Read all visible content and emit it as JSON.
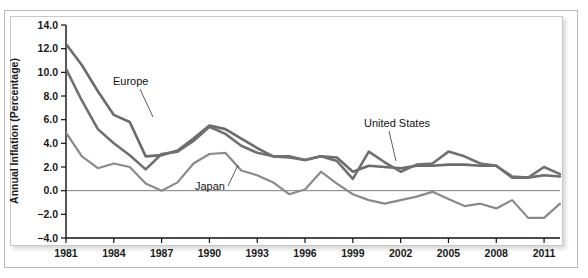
{
  "figure": {
    "background_color": "#ffffff",
    "frame_color": "#b9b9b9",
    "panel_border_color": "#c8c8c8"
  },
  "chart_data": {
    "type": "line",
    "title": "",
    "subtitle": "",
    "xlabel": "",
    "ylabel": "Annual Inflation (Percentage)",
    "xlim": [
      1981,
      2012
    ],
    "ylim": [
      -4.0,
      14.0
    ],
    "grid": false,
    "legend_position": "inline-annotations",
    "y_ticks": [
      -4.0,
      -2.0,
      0.0,
      2.0,
      4.0,
      6.0,
      8.0,
      10.0,
      12.0,
      14.0
    ],
    "y_tick_labels": [
      "−4.0",
      "−2.0",
      "0.0",
      "2.0",
      "4.0",
      "6.0",
      "8.0",
      "10.0",
      "12.0",
      "14.0"
    ],
    "x_ticks": [
      1981,
      1984,
      1987,
      1990,
      1993,
      1996,
      1999,
      2002,
      2005,
      2008,
      2011
    ],
    "x_tick_labels": [
      "1981",
      "1984",
      "1987",
      "1990",
      "1993",
      "1996",
      "1999",
      "2002",
      "2005",
      "2008",
      "2011"
    ],
    "x": [
      1981,
      1982,
      1983,
      1984,
      1985,
      1986,
      1987,
      1988,
      1989,
      1990,
      1991,
      1992,
      1993,
      1994,
      1995,
      1996,
      1997,
      1998,
      1999,
      2000,
      2001,
      2002,
      2003,
      2004,
      2005,
      2006,
      2007,
      2008,
      2009,
      2010,
      2011,
      2012
    ],
    "series": [
      {
        "name": "Europe",
        "color": "#6b6b6b",
        "line_width": 2.6,
        "values": [
          12.4,
          10.6,
          8.4,
          6.4,
          5.8,
          2.9,
          3.0,
          3.4,
          4.4,
          5.5,
          5.2,
          4.4,
          3.6,
          2.9,
          2.9,
          2.6,
          2.9,
          2.8,
          1.6,
          2.1,
          2.0,
          1.9,
          2.1,
          2.1,
          2.2,
          2.2,
          2.1,
          2.1,
          1.2,
          1.1,
          1.3,
          1.2
        ]
      },
      {
        "name": "United States",
        "color": "#707070",
        "line_width": 2.6,
        "values": [
          10.3,
          7.6,
          5.2,
          4.0,
          3.0,
          1.8,
          3.1,
          3.3,
          4.2,
          5.4,
          4.8,
          3.8,
          3.2,
          2.9,
          2.8,
          2.6,
          2.9,
          2.5,
          1.0,
          3.3,
          2.4,
          1.6,
          2.2,
          2.3,
          3.3,
          2.9,
          2.3,
          2.1,
          1.1,
          1.1,
          2.0,
          1.4
        ]
      },
      {
        "name": "Japan",
        "color": "#8a8a8a",
        "line_width": 2.2,
        "values": [
          4.9,
          2.9,
          1.9,
          2.3,
          2.0,
          0.6,
          0.0,
          0.7,
          2.3,
          3.1,
          3.2,
          1.7,
          1.3,
          0.7,
          -0.3,
          0.1,
          1.6,
          0.6,
          -0.3,
          -0.8,
          -1.1,
          -0.8,
          -0.5,
          -0.1,
          -0.7,
          -1.3,
          -1.1,
          -1.5,
          -0.8,
          -2.3,
          -2.3,
          -1.1
        ]
      }
    ],
    "annotations": [
      {
        "text": "Europe",
        "label_x": 113,
        "label_y": 85,
        "leader": [
          [
            140,
            89
          ],
          [
            153,
            117
          ]
        ]
      },
      {
        "text": "Japan",
        "label_x": 195,
        "label_y": 190,
        "leader": [
          [
            228,
            186
          ],
          [
            238,
            165
          ]
        ]
      },
      {
        "text": "United States",
        "label_x": 364,
        "label_y": 127,
        "leader": [
          [
            389,
            131
          ],
          [
            396,
            161
          ]
        ]
      }
    ]
  }
}
